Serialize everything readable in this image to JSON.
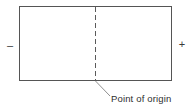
{
  "diagram": {
    "colors": {
      "background": "#ffffff",
      "outline": "#555555",
      "dashed_line": "#5a5a5a",
      "leader_line": "#8a8a8a",
      "text": "#2e2e2e"
    },
    "rectangle": {
      "name": "field-rectangle",
      "fill": "#ffffff",
      "x": 19,
      "y": 6,
      "width": 153,
      "height": 75
    },
    "origin_axis": {
      "name": "point-of-origin-dashed-line",
      "x": 95,
      "y_top": 6,
      "y_bottom": 81,
      "style": "dashed",
      "dash": "5 3"
    },
    "leader": {
      "name": "origin-leader-line",
      "x1": 95,
      "y1": 81,
      "x2": 110,
      "y2": 96
    },
    "labels": {
      "negative_sign": "–",
      "positive_sign": "+",
      "origin_caption": "Point of origin"
    }
  }
}
